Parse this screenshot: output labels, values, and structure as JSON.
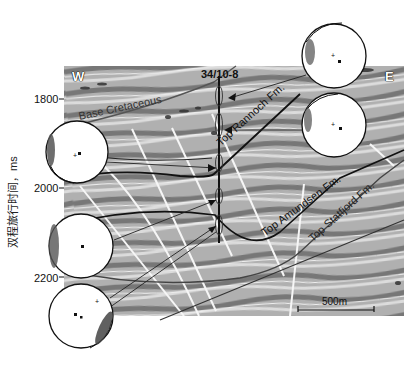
{
  "figure": {
    "well_name": "34/10-8",
    "compass": {
      "west": "W",
      "east": "E"
    },
    "y_axis": {
      "title": "双程旅行时间，ms",
      "ticks": [
        "1800",
        "2000",
        "2200"
      ]
    },
    "horizons": [
      {
        "name": "Base Cretaceous",
        "style": "gray-line"
      },
      {
        "name": "Top Rannoch Fm.",
        "style": "black-line"
      },
      {
        "name": "Top Amundsen Fm.",
        "style": "black-line"
      },
      {
        "name": "Top Statfjord Fm.",
        "style": "gray-line"
      }
    ],
    "scale_bar": {
      "label": "500m"
    },
    "stereonets": [
      {
        "id": "net-top-right-1",
        "position": "upper-right"
      },
      {
        "id": "net-top-right-2",
        "position": "right"
      },
      {
        "id": "net-left-1",
        "position": "left-upper"
      },
      {
        "id": "net-left-2",
        "position": "left-middle"
      },
      {
        "id": "net-left-3",
        "position": "left-lower"
      }
    ],
    "colors": {
      "background": "#ffffff",
      "seismic_light": "#d8d8d8",
      "seismic_mid": "#9a9a9a",
      "seismic_dark": "#5a5a5a",
      "horizon_black": "#111111",
      "horizon_gray": "#555555",
      "fault_white": "#f4f4f4"
    }
  }
}
